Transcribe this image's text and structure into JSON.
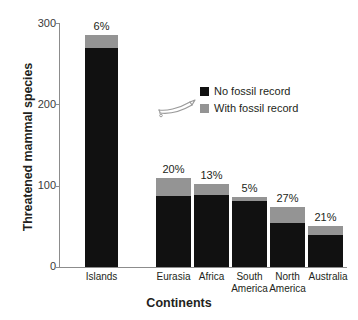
{
  "chart_data": {
    "type": "bar",
    "subtype": "stacked-bar",
    "title": "",
    "xlabel": "Continents",
    "ylabel": "Threatened mammal species",
    "ylim": [
      0,
      300
    ],
    "yticks": [
      0,
      100,
      200,
      300
    ],
    "ytick_labels": [
      "0",
      "100",
      "200",
      "300"
    ],
    "grid": false,
    "legend_position": "upper-center-right",
    "categories": [
      "Islands",
      "Eurasia",
      "Africa",
      "South America",
      "North America",
      "Australia"
    ],
    "series": [
      {
        "name": "No fossil record",
        "color": "#111111",
        "values": [
          270,
          88,
          89,
          81,
          54,
          40
        ]
      },
      {
        "name": "With fossil record",
        "color": "#949494",
        "values": [
          17,
          22,
          13,
          5,
          20,
          11
        ]
      }
    ],
    "totals": [
      287,
      110,
      102,
      86,
      74,
      51
    ],
    "annotations": [
      "6%",
      "20%",
      "13%",
      "5%",
      "27%",
      "21%"
    ],
    "annotation_note": "percentage of each bar's total that has a fossil record"
  },
  "axes": {
    "y_title": "Threatened mammal species",
    "x_title": "Continents",
    "y_ticks": [
      {
        "label": "300",
        "value": 300
      },
      {
        "label": "200",
        "value": 200
      },
      {
        "label": "100",
        "value": 100
      },
      {
        "label": "0",
        "value": 0
      }
    ]
  },
  "bars": [
    {
      "category": "Islands",
      "label_lines": [
        "Islands"
      ],
      "pct": "6%",
      "black": 270,
      "gray": 17
    },
    {
      "category": "Eurasia",
      "label_lines": [
        "Eurasia"
      ],
      "pct": "20%",
      "black": 88,
      "gray": 22
    },
    {
      "category": "Africa",
      "label_lines": [
        "Africa"
      ],
      "pct": "13%",
      "black": 89,
      "gray": 13
    },
    {
      "category": "South America",
      "label_lines": [
        "South",
        "America"
      ],
      "pct": "5%",
      "black": 81,
      "gray": 5
    },
    {
      "category": "North America",
      "label_lines": [
        "North",
        "America"
      ],
      "pct": "27%",
      "black": 54,
      "gray": 20
    },
    {
      "category": "Australia",
      "label_lines": [
        "Australia"
      ],
      "pct": "21%",
      "black": 40,
      "gray": 11
    }
  ],
  "legend": {
    "items": [
      {
        "label": "No fossil record",
        "color": "#111111"
      },
      {
        "label": "With fossil record",
        "color": "#949494"
      }
    ],
    "decoration_icon": "fossil-bone-icon"
  },
  "colors": {
    "no_fossil_record": "#111111",
    "with_fossil_record": "#949494",
    "axis": "#8c8c8c",
    "text": "#231f20",
    "background": "#ffffff"
  }
}
